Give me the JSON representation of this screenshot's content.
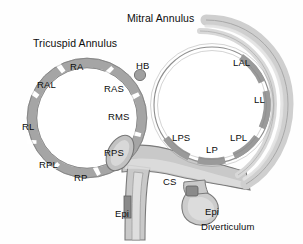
{
  "figure": {
    "kind": "anatomical-diagram",
    "background_color": "#fefefe",
    "ink_color": "#0d0d0d",
    "ring_dark_color": "#9a9a9a",
    "ring_mid_color": "#b3b3b3",
    "ring_light_color": "#cfcfcf",
    "tissue_fill_color": "#c9c9c9",
    "outline_color": "#6f6f6f"
  },
  "titles": {
    "tricuspid": "Tricuspid Annulus",
    "mitral": "Mitral Annulus"
  },
  "tricuspid_segments": [
    {
      "label": "RA",
      "x": 70,
      "y": 62
    },
    {
      "label": "RAL",
      "x": 37,
      "y": 80
    },
    {
      "label": "RL",
      "x": 22,
      "y": 122
    },
    {
      "label": "RPL",
      "x": 39,
      "y": 160
    },
    {
      "label": "RP",
      "x": 74,
      "y": 173
    },
    {
      "label": "RPS",
      "x": 104,
      "y": 148
    },
    {
      "label": "RMS",
      "x": 108,
      "y": 112
    },
    {
      "label": "RAS",
      "x": 104,
      "y": 84
    }
  ],
  "mitral_segments": [
    {
      "label": "LAL",
      "x": 233,
      "y": 58
    },
    {
      "label": "LL",
      "x": 254,
      "y": 95
    },
    {
      "label": "LPL",
      "x": 230,
      "y": 133
    },
    {
      "label": "LP",
      "x": 206,
      "y": 145
    },
    {
      "label": "LPS",
      "x": 172,
      "y": 133
    }
  ],
  "structures": [
    {
      "label": "HB",
      "name": "his-bundle",
      "x": 136,
      "y": 61
    },
    {
      "label": "CS",
      "name": "coronary-sinus",
      "x": 163,
      "y": 177
    },
    {
      "label": "Epi",
      "name": "epicardial-left",
      "x": 115,
      "y": 209
    },
    {
      "label": "Epi",
      "name": "epicardial-right",
      "x": 205,
      "y": 207
    },
    {
      "label": "Diverticulum",
      "name": "diverticulum",
      "x": 201,
      "y": 222
    }
  ]
}
